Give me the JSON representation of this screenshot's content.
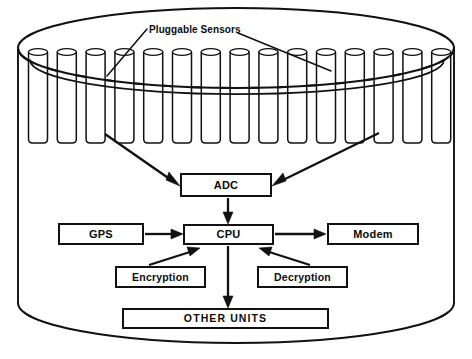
{
  "diagram": {
    "title_label": "Pluggable Sensors",
    "colors": {
      "stroke": "#111111",
      "background": "#ffffff",
      "text": "#0b0b0b"
    },
    "sensor_array": {
      "name": "pluggable-sensor-tubes",
      "count": 15,
      "first_center_x": 38,
      "spacing": 28.8,
      "tube_width": 19,
      "tube_top": 52,
      "tube_bottom": 143
    },
    "vessel": {
      "name": "outer-cylinder-enclosure",
      "cx": 236,
      "top_ellipse_cy": 48,
      "rx": 218,
      "ry": 40,
      "body_bottom_cy": 303
    },
    "nodes": [
      {
        "id": "adc",
        "label": "ADC"
      },
      {
        "id": "cpu",
        "label": "CPU"
      },
      {
        "id": "gps",
        "label": "GPS"
      },
      {
        "id": "modem",
        "label": "Modem"
      },
      {
        "id": "encrypt",
        "label": "Encryption"
      },
      {
        "id": "decrypt",
        "label": "Decryption"
      },
      {
        "id": "other",
        "label": "OTHER UNITS"
      }
    ],
    "connections": [
      {
        "from": "sensors-left",
        "to": "adc",
        "style": "arrow"
      },
      {
        "from": "sensors-right",
        "to": "adc",
        "style": "arrow"
      },
      {
        "from": "adc",
        "to": "cpu",
        "style": "arrow"
      },
      {
        "from": "gps",
        "to": "cpu",
        "style": "arrow"
      },
      {
        "from": "cpu",
        "to": "modem",
        "style": "arrow"
      },
      {
        "from": "encrypt",
        "to": "cpu",
        "style": "arrow"
      },
      {
        "from": "decrypt",
        "to": "cpu",
        "style": "arrow"
      },
      {
        "from": "cpu",
        "to": "other",
        "style": "arrow"
      }
    ]
  }
}
